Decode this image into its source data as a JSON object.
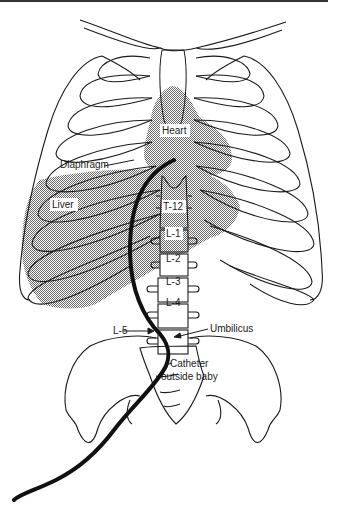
{
  "figure": {
    "type": "anatomical diagram",
    "colors": {
      "line": "#1a1a1a",
      "shading": "#9a9a9a",
      "catheter": "#111111",
      "background": "#ffffff"
    }
  },
  "labels": {
    "heart": "Heart",
    "diaphragm": "Diaphragm",
    "liver": "Liver",
    "t12": "T-12",
    "l1": "L-1",
    "l2": "L-2",
    "l3": "L-3",
    "l4": "L-4",
    "l5": "L-5",
    "umbilicus": "Umbilicus",
    "catheter_line1": "Catheter",
    "catheter_line2": "outside baby"
  }
}
